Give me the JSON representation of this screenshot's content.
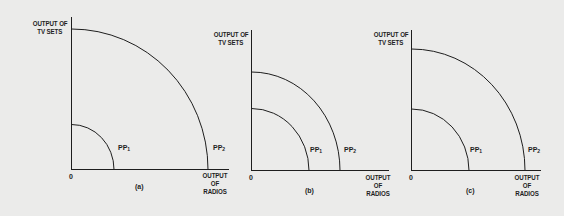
{
  "figure": {
    "panels": [
      {
        "id": "a",
        "caption": "(a)",
        "y_axis_label_line1": "OUTPUT OF",
        "y_axis_label_line2": "TV SETS",
        "x_axis_label_line1": "OUTPUT",
        "x_axis_label_line2": "OF",
        "x_axis_label_line3": "RADIOS",
        "origin": "0",
        "curves": [
          {
            "name": "PP",
            "sub": "1"
          },
          {
            "name": "PP",
            "sub": "2"
          }
        ]
      },
      {
        "id": "b",
        "caption": "(b)",
        "y_axis_label_line1": "OUTPUT OF",
        "y_axis_label_line2": "TV SETS",
        "x_axis_label_line1": "OUTPUT",
        "x_axis_label_line2": "OF",
        "x_axis_label_line3": "RADIOS",
        "origin": "0",
        "curves": [
          {
            "name": "PP",
            "sub": "1"
          },
          {
            "name": "PP",
            "sub": "2"
          }
        ]
      },
      {
        "id": "c",
        "caption": "(c)",
        "y_axis_label_line1": "OUTPUT OF",
        "y_axis_label_line2": "TV SETS",
        "x_axis_label_line1": "OUTPUT",
        "x_axis_label_line2": "OF",
        "x_axis_label_line3": "RADIOS",
        "origin": "0",
        "curves": [
          {
            "name": "PP",
            "sub": "1"
          },
          {
            "name": "PP",
            "sub": "2"
          }
        ]
      }
    ],
    "colors": {
      "background": "#ebebea",
      "ink": "#1e1e1e"
    }
  }
}
